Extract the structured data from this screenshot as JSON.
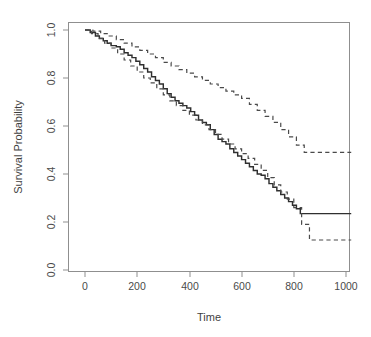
{
  "chart_data": {
    "type": "line",
    "title": "",
    "subtitle": "",
    "xlabel": "Time",
    "ylabel": "Survival Probability",
    "xlim": [
      -20,
      1040
    ],
    "ylim": [
      0.0,
      1.0
    ],
    "grid": false,
    "legend": null,
    "x_ticks": [
      0,
      200,
      400,
      600,
      800,
      1000
    ],
    "x_tick_labels": [
      "0",
      "200",
      "400",
      "600",
      "800",
      "1000"
    ],
    "y_ticks": [
      0.0,
      0.2,
      0.4,
      0.6,
      0.8,
      1.0
    ],
    "y_tick_labels": [
      "0.0",
      "0.2",
      "0.4",
      "0.6",
      "0.8",
      "1.0"
    ],
    "annotations": [],
    "series": [
      {
        "name": "Kaplan-Meier estimate",
        "style": "solid",
        "color": "#2f2f2f",
        "step": true,
        "x": [
          0,
          20,
          40,
          55,
          70,
          85,
          100,
          120,
          135,
          150,
          165,
          180,
          195,
          210,
          225,
          240,
          255,
          270,
          285,
          300,
          315,
          330,
          345,
          360,
          375,
          390,
          405,
          420,
          435,
          450,
          465,
          480,
          495,
          510,
          525,
          540,
          555,
          570,
          585,
          600,
          615,
          630,
          645,
          660,
          675,
          690,
          705,
          720,
          735,
          750,
          765,
          780,
          795,
          810,
          825,
          1020
        ],
        "y": [
          1.0,
          0.99,
          0.975,
          0.965,
          0.955,
          0.945,
          0.935,
          0.93,
          0.92,
          0.905,
          0.895,
          0.885,
          0.87,
          0.855,
          0.84,
          0.825,
          0.805,
          0.79,
          0.775,
          0.755,
          0.735,
          0.72,
          0.705,
          0.695,
          0.685,
          0.675,
          0.66,
          0.645,
          0.625,
          0.615,
          0.605,
          0.585,
          0.565,
          0.545,
          0.535,
          0.525,
          0.505,
          0.49,
          0.475,
          0.46,
          0.445,
          0.43,
          0.415,
          0.4,
          0.395,
          0.38,
          0.36,
          0.345,
          0.33,
          0.315,
          0.3,
          0.285,
          0.27,
          0.255,
          0.235,
          0.235
        ]
      },
      {
        "name": "Upper 95% confidence limit",
        "style": "dashed",
        "color": "#4a4a4a",
        "step": true,
        "x": [
          0,
          30,
          60,
          90,
          120,
          150,
          180,
          210,
          240,
          270,
          300,
          330,
          360,
          390,
          420,
          450,
          480,
          510,
          540,
          570,
          600,
          630,
          660,
          690,
          720,
          750,
          780,
          810,
          840,
          1020
        ],
        "y": [
          1.0,
          0.995,
          0.985,
          0.975,
          0.96,
          0.945,
          0.93,
          0.915,
          0.9,
          0.885,
          0.865,
          0.85,
          0.835,
          0.82,
          0.805,
          0.79,
          0.775,
          0.76,
          0.745,
          0.73,
          0.715,
          0.69,
          0.665,
          0.64,
          0.615,
          0.585,
          0.555,
          0.52,
          0.49,
          0.49
        ]
      },
      {
        "name": "Lower 95% confidence limit",
        "style": "dashed",
        "color": "#4a4a4a",
        "step": true,
        "x": [
          0,
          25,
          50,
          75,
          100,
          125,
          150,
          175,
          200,
          225,
          250,
          275,
          300,
          325,
          350,
          375,
          400,
          425,
          450,
          475,
          500,
          525,
          550,
          575,
          600,
          625,
          650,
          675,
          700,
          725,
          750,
          775,
          800,
          830,
          860,
          1020
        ],
        "y": [
          1.0,
          0.985,
          0.965,
          0.945,
          0.925,
          0.9,
          0.875,
          0.85,
          0.825,
          0.8,
          0.78,
          0.755,
          0.73,
          0.705,
          0.685,
          0.665,
          0.645,
          0.625,
          0.605,
          0.585,
          0.565,
          0.545,
          0.525,
          0.505,
          0.485,
          0.465,
          0.44,
          0.415,
          0.385,
          0.355,
          0.325,
          0.295,
          0.26,
          0.19,
          0.125,
          0.125
        ]
      }
    ],
    "plateau_values": {
      "estimate": 0.235,
      "upper": 0.49,
      "lower": 0.125
    }
  },
  "figure": {
    "background_color": "#ffffff",
    "frame_color": "#8f8f8f",
    "estimate_color": "#2f2f2f",
    "band_color": "#4a4a4a"
  }
}
